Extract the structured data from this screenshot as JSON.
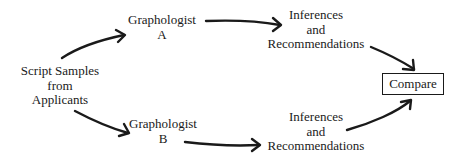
{
  "diagram": {
    "source": {
      "lines": [
        "Script Samples",
        "from",
        "Applicants"
      ]
    },
    "graphologist_a": {
      "lines": [
        "Graphologist",
        "A"
      ]
    },
    "graphologist_b": {
      "lines": [
        "Graphologist",
        "B"
      ]
    },
    "inferences_a": {
      "lines": [
        "Inferences",
        "and",
        "Recommendations"
      ]
    },
    "inferences_b": {
      "lines": [
        "Inferences",
        "and",
        "Recommendations"
      ]
    },
    "compare": {
      "label": "Compare"
    },
    "edges": [
      {
        "from": "source",
        "to": "graphologist_a"
      },
      {
        "from": "source",
        "to": "graphologist_b"
      },
      {
        "from": "graphologist_a",
        "to": "inferences_a"
      },
      {
        "from": "graphologist_b",
        "to": "inferences_b"
      },
      {
        "from": "inferences_a",
        "to": "compare"
      },
      {
        "from": "inferences_b",
        "to": "compare"
      }
    ],
    "colors": {
      "ink": "#1a1a1a",
      "background": "#ffffff"
    }
  }
}
